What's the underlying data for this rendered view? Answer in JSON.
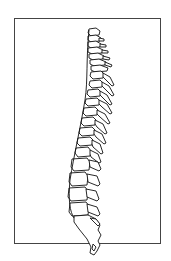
{
  "image": {
    "subject": "Human spine, lateral (sagittal) view line illustration",
    "style": "black line art on white",
    "frame_color": "#444444",
    "line_color": "#111111",
    "background": "#ffffff"
  }
}
